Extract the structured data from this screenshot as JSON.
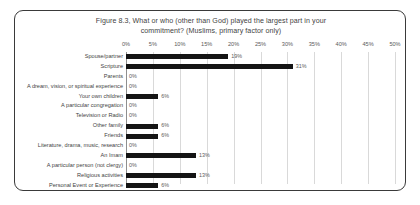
{
  "chart_data": {
    "type": "bar",
    "orientation": "horizontal",
    "title": "Figure 8.3, What or who (other than God) played the largest part in your commitment? (Muslims, primary factor only)",
    "title_line1": "Figure 8.3, What or who (other than God) played the largest part in your",
    "title_line2": "commitment? (Muslims, primary factor only)",
    "xlabel": "",
    "ylabel": "",
    "xlim": [
      0,
      50
    ],
    "grid": true,
    "legend": "none",
    "tick_labels": [
      "0%",
      "5%",
      "10%",
      "15%",
      "20%",
      "25%",
      "30%",
      "35%",
      "40%",
      "45%",
      "50%"
    ],
    "tick_values": [
      0,
      5,
      10,
      15,
      20,
      25,
      30,
      35,
      40,
      45,
      50
    ],
    "categories": [
      "Spouse/partner",
      "Scripture",
      "Parents",
      "A dream, vision, or spiritual experience",
      "Your own children",
      "A particular congregation",
      "Television or Radio",
      "Other family",
      "Friends",
      "Literature, drama, music, research",
      "An Imam",
      "A particular person (not clergy)",
      "Religious activities",
      "Personal Event or Experience"
    ],
    "values": [
      19,
      31,
      0,
      0,
      6,
      0,
      0,
      6,
      6,
      0,
      13,
      0,
      13,
      6
    ],
    "data_labels": [
      "19%",
      "31%",
      "0%",
      "0%",
      "6%",
      "0%",
      "0%",
      "6%",
      "6%",
      "0%",
      "13%",
      "0%",
      "13%",
      "6%"
    ],
    "bar_color": "#141414",
    "grid_color": "#d9d9d9",
    "axis_color": "#8f8f8f",
    "text_color": "#3f3f3f"
  }
}
